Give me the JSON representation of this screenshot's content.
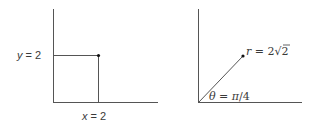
{
  "diagram": {
    "left": {
      "title": "Rectangular coordinates",
      "y_label_var": "y",
      "y_label_rest": " = 2",
      "x_label_var": "x",
      "x_label_rest": " = 2",
      "point": {
        "x": 2,
        "y": 2
      }
    },
    "right": {
      "title": "Polar coordinates",
      "r_label_var": "r",
      "r_label_rest": " = 2",
      "r_label_radical": "√2",
      "theta_label_var": "θ",
      "theta_label_eq": " = ",
      "theta_label_pi": "π",
      "theta_label_rest": "/4",
      "point": {
        "r": "2√2",
        "theta": "π/4"
      }
    },
    "colors": {
      "axis": "#555555",
      "guide": "#555555",
      "point": "#111111",
      "text": "#3a3a3a"
    }
  }
}
